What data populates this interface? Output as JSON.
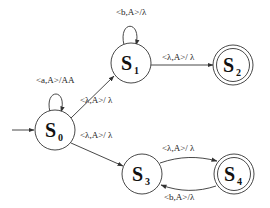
{
  "diagram": {
    "type": "pushdown-automaton",
    "states": [
      {
        "id": "S0",
        "letter": "S",
        "sub": "0",
        "initial": true,
        "accepting": false
      },
      {
        "id": "S1",
        "letter": "S",
        "sub": "1",
        "initial": false,
        "accepting": false
      },
      {
        "id": "S2",
        "letter": "S",
        "sub": "2",
        "initial": false,
        "accepting": true
      },
      {
        "id": "S3",
        "letter": "S",
        "sub": "3",
        "initial": false,
        "accepting": false
      },
      {
        "id": "S4",
        "letter": "S",
        "sub": "4",
        "initial": false,
        "accepting": true
      }
    ],
    "transitions": [
      {
        "from": "S0",
        "to": "S0",
        "label": "<a,A>/AA"
      },
      {
        "from": "S0",
        "to": "S1",
        "label": "<λ,A>/ λ"
      },
      {
        "from": "S0",
        "to": "S3",
        "label": "<λ,A>/ λ"
      },
      {
        "from": "S1",
        "to": "S1",
        "label": "<b,A>/λ"
      },
      {
        "from": "S1",
        "to": "S2",
        "label": "<λ,A>/ λ"
      },
      {
        "from": "S3",
        "to": "S4",
        "label": "<λ,A>/ λ"
      },
      {
        "from": "S4",
        "to": "S3",
        "label": "<b,A>/λ"
      }
    ]
  }
}
